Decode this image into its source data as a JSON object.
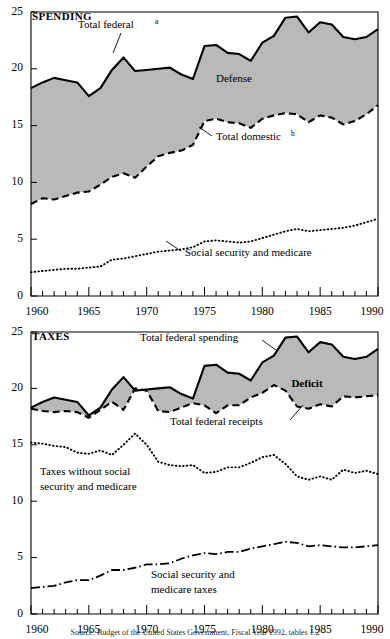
{
  "figure": {
    "fill_color": "#b9b9b9",
    "line_color": "#000000",
    "background": "#ffffff",
    "source_note": "Source: Budget of the United States Government, Fiscal Year 1992, tables 1.2"
  },
  "panels": [
    {
      "id": "spending",
      "title": "SPENDING",
      "annotations": {
        "total_federal": "Total federal",
        "total_federal_sup": "a",
        "defense": "Defense",
        "total_domestic": "Total domestic",
        "total_domestic_sup": "b",
        "social_security": "Social security and medicare"
      }
    },
    {
      "id": "taxes",
      "title": "TAXES",
      "annotations": {
        "total_federal_spending": "Total federal spending",
        "deficit": "Deficit",
        "total_federal_receipts": "Total federal receipts",
        "taxes_without_line1": "Taxes without social",
        "taxes_without_line2": "security and medicare",
        "ss_taxes_line1": "Social security and",
        "ss_taxes_line2": "medicare taxes"
      }
    }
  ],
  "axis": {
    "y_ticks": [
      "0",
      "5",
      "10",
      "15",
      "20",
      "25"
    ],
    "y_min": 0,
    "y_max": 25,
    "x_ticks": [
      "1960",
      "1965",
      "1970",
      "1975",
      "1980",
      "1985",
      "1990"
    ],
    "x_min": 1960,
    "x_max": 1990,
    "x_minor_step": 1,
    "grid": false
  },
  "chart_data": [
    {
      "type": "area",
      "id": "spending",
      "title": "SPENDING",
      "xlabel": "",
      "ylabel": "",
      "xlim": [
        1960,
        1990
      ],
      "ylim": [
        0,
        25
      ],
      "grid": false,
      "legend": "inline-annotations",
      "x": [
        1960,
        1961,
        1962,
        1963,
        1964,
        1965,
        1966,
        1967,
        1968,
        1969,
        1970,
        1971,
        1972,
        1973,
        1974,
        1975,
        1976,
        1977,
        1978,
        1979,
        1980,
        1981,
        1982,
        1983,
        1984,
        1985,
        1986,
        1987,
        1988,
        1989,
        1990
      ],
      "series": [
        {
          "name": "Total federal",
          "style": "solid",
          "values": [
            18.3,
            18.8,
            19.2,
            19.0,
            18.8,
            17.6,
            18.3,
            19.9,
            21.0,
            19.8,
            19.9,
            20.0,
            20.1,
            19.5,
            19.1,
            22.0,
            22.1,
            21.4,
            21.3,
            20.7,
            22.3,
            22.9,
            24.5,
            24.6,
            23.2,
            24.1,
            23.9,
            22.8,
            22.6,
            22.8,
            23.5
          ]
        },
        {
          "name": "Total domestic",
          "style": "dashed",
          "values": [
            8.1,
            8.6,
            8.5,
            8.8,
            9.1,
            9.2,
            9.8,
            10.5,
            10.8,
            10.4,
            11.4,
            12.3,
            12.6,
            12.8,
            13.3,
            15.4,
            15.6,
            15.3,
            15.2,
            14.8,
            15.6,
            15.9,
            16.1,
            16.0,
            15.3,
            15.9,
            15.7,
            15.1,
            15.4,
            16.0,
            16.8
          ]
        },
        {
          "name": "Social security and medicare",
          "style": "dotted",
          "values": [
            2.1,
            2.2,
            2.3,
            2.4,
            2.4,
            2.5,
            2.6,
            3.2,
            3.3,
            3.5,
            3.7,
            3.9,
            4.0,
            4.1,
            4.3,
            4.8,
            4.9,
            4.8,
            4.7,
            4.8,
            5.1,
            5.4,
            5.7,
            5.9,
            5.7,
            5.8,
            5.9,
            6.0,
            6.2,
            6.5,
            6.8
          ]
        }
      ],
      "filled_band": {
        "label": "Defense",
        "between": [
          "Total federal",
          "Total domestic"
        ]
      }
    },
    {
      "type": "area",
      "id": "taxes",
      "title": "TAXES",
      "xlabel": "",
      "ylabel": "",
      "xlim": [
        1960,
        1990
      ],
      "ylim": [
        0,
        25
      ],
      "grid": false,
      "legend": "inline-annotations",
      "x": [
        1960,
        1961,
        1962,
        1963,
        1964,
        1965,
        1966,
        1967,
        1968,
        1969,
        1970,
        1971,
        1972,
        1973,
        1974,
        1975,
        1976,
        1977,
        1978,
        1979,
        1980,
        1981,
        1982,
        1983,
        1984,
        1985,
        1986,
        1987,
        1988,
        1989,
        1990
      ],
      "series": [
        {
          "name": "Total federal spending",
          "style": "solid",
          "values": [
            18.3,
            18.8,
            19.2,
            19.0,
            18.8,
            17.6,
            18.3,
            19.9,
            21.0,
            19.8,
            19.9,
            20.0,
            20.1,
            19.5,
            19.1,
            22.0,
            22.1,
            21.4,
            21.3,
            20.7,
            22.3,
            22.9,
            24.5,
            24.6,
            23.2,
            24.1,
            23.9,
            22.8,
            22.6,
            22.8,
            23.5
          ]
        },
        {
          "name": "Total federal receipts",
          "style": "dashed",
          "values": [
            18.2,
            18.0,
            17.9,
            18.0,
            17.9,
            17.4,
            18.1,
            18.8,
            18.1,
            20.0,
            19.8,
            18.0,
            17.9,
            18.3,
            18.7,
            18.5,
            17.8,
            18.5,
            18.5,
            19.2,
            19.6,
            20.3,
            19.8,
            18.4,
            18.2,
            18.6,
            18.4,
            19.3,
            19.2,
            19.3,
            19.4
          ]
        },
        {
          "name": "Taxes without social security and medicare",
          "style": "dotted",
          "values": [
            15.2,
            15.1,
            14.9,
            14.8,
            14.3,
            14.2,
            14.5,
            14.1,
            15.0,
            16.0,
            15.0,
            13.5,
            13.2,
            13.1,
            13.2,
            12.5,
            12.6,
            13.0,
            13.0,
            13.4,
            13.9,
            14.1,
            13.3,
            12.2,
            11.9,
            12.2,
            11.9,
            12.8,
            12.5,
            12.7,
            12.4
          ]
        },
        {
          "name": "Social security and medicare taxes",
          "style": "dashdot",
          "values": [
            2.3,
            2.4,
            2.5,
            2.8,
            3.0,
            3.0,
            3.4,
            3.9,
            3.9,
            4.1,
            4.4,
            4.4,
            4.5,
            4.9,
            5.2,
            5.4,
            5.3,
            5.5,
            5.5,
            5.8,
            6.0,
            6.2,
            6.4,
            6.3,
            6.0,
            6.1,
            6.0,
            5.9,
            5.9,
            6.0,
            6.1
          ]
        }
      ],
      "filled_band": {
        "label": "Deficit",
        "between": [
          "Total federal spending",
          "Total federal receipts"
        ]
      }
    }
  ]
}
